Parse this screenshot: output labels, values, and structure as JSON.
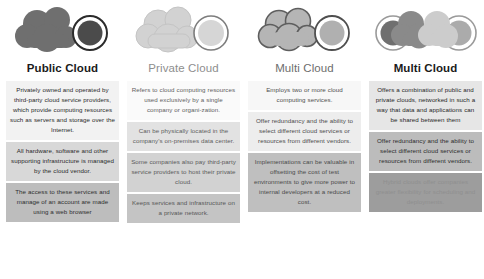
{
  "columns": [
    {
      "id": "public-cloud",
      "title": "Public Cloud",
      "icon": "cloud-dark-with-circle-icon",
      "boxes": [
        "Privately owned and operated by third-party cloud service providers, which provide computing resources such as servers and storage over the Internet.",
        "All hardware, software and other supporting infrastructure is managed by the cloud vendor.",
        "The access to these services and manage of an account are made using a web browser"
      ]
    },
    {
      "id": "private-cloud",
      "title": "Private Cloud",
      "icon": "cloud-light-with-circle-icon",
      "boxes": [
        "Refers to cloud computing resources used exclusively by a single company or organi-zation.",
        "Can be physically located in the company's on-premises data center.",
        "Some companies also pay third-party service providers to host their private cloud.",
        "Keeps services and infrastructure on a private network."
      ]
    },
    {
      "id": "multi-cloud",
      "title": "Multi Cloud",
      "icon": "cloud-outline-with-circle-icon",
      "boxes": [
        "Employs two or more cloud computing services.",
        "Offer redundancy and the ability to select different cloud services or resources from different vendors.",
        "Implementations can be valuable in offsetting the cost of test environments to give more power to internal developers at a reduced cost."
      ]
    },
    {
      "id": "hybrid-multi-cloud",
      "title": "Multi Cloud",
      "icon": "double-cloud-with-circles-icon",
      "boxes": [
        "Offers a combination of public and private clouds, networked in such a way that data and applications can be shared between them",
        "Offer redundancy and the ability to select different cloud services or resources from different vendors.",
        "Hybrid clouds offer companies greater flexibility for scheduling and deployments."
      ]
    }
  ],
  "palette": {
    "background": "#ffffff",
    "icon_dark": "#6e6e6e",
    "icon_darker": "#4a4a4a",
    "icon_light": "#cfcfcf",
    "icon_mid": "#a8a8a8",
    "icon_outline": "#6b6b6b",
    "title_dark": "#1b1b1b",
    "title_muted": "#8e8e8e"
  }
}
